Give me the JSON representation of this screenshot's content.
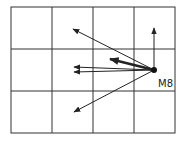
{
  "diagram": {
    "grid": {
      "cols": 4,
      "rows": 3,
      "x0": 11,
      "y0": 7,
      "x1": 175,
      "y1": 133,
      "color": "#333333"
    },
    "origin": {
      "label": "M8",
      "x": 154,
      "y": 70
    },
    "arrows": [
      {
        "name": "arrow-up",
        "x2": 154,
        "y2": 28,
        "weight": 1
      },
      {
        "name": "arrow-upper-left",
        "x2": 73,
        "y2": 29,
        "weight": 1
      },
      {
        "name": "arrow-thick-left",
        "x2": 110,
        "y2": 59,
        "weight": 2.4
      },
      {
        "name": "arrow-left-upper",
        "x2": 74,
        "y2": 67,
        "weight": 1
      },
      {
        "name": "arrow-left-lower",
        "x2": 74,
        "y2": 72,
        "weight": 1
      },
      {
        "name": "arrow-lower-left",
        "x2": 74,
        "y2": 112,
        "weight": 1
      }
    ]
  }
}
